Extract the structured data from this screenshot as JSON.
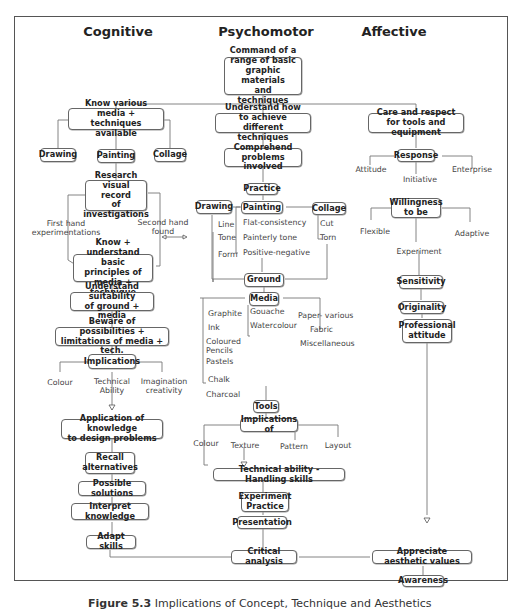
{
  "headers": {
    "cognitive": "Cognitive",
    "psychomotor": "Psychomotor",
    "affective": "Affective"
  },
  "root": "Command of a\nrange of basic\ngraphic materials\nand techniques",
  "cognitive": {
    "know_media": "Know various media +\ntechniques available",
    "drawing": "Drawing",
    "painting": "Painting",
    "collage": "Collage",
    "research": "Research visual\nrecord\nof investigations",
    "first_hand": "First hand\nexperimentations",
    "second_hand": "Second hand\nfound",
    "know_understand": "Know + understand\nbasic principles of\nmedia + technique",
    "suitability": "Understand suitability\nof ground + media",
    "beware": "Beware of possibilities +\nlimitations of media + tech.",
    "implications": "Implications",
    "impl_children": [
      "Colour",
      "Technical\nAbility",
      "Imagination\ncreativity"
    ],
    "application": "Application of knowledge\nto design problems",
    "recall": "Recall\nalternatives",
    "possible": "Possible solutions",
    "interpret": "Interpret knowledge",
    "adapt": "Adapt skills"
  },
  "psychomotor": {
    "understand": "Understand how to achieve\ndifferent techniques",
    "comprehend": "Comprehend problems\ninvolved",
    "practice": "Practice",
    "drawing": "Drawing",
    "drawing_items": [
      "Line",
      "Tone",
      "Form"
    ],
    "painting": "Painting",
    "painting_items": [
      "Flat-consistency",
      "Painterly tone",
      "Positive-negative"
    ],
    "collage": "Collage",
    "collage_items": [
      "Cut",
      "Torn"
    ],
    "ground": "Ground",
    "media": "Media",
    "media_left": [
      "Graphite",
      "Ink",
      "Coloured\nPencils",
      "Pastels",
      "Chalk",
      "Charcoal"
    ],
    "media_mid": [
      "Gouache",
      "Watercolour"
    ],
    "media_right": [
      "Paper- various",
      "Fabric",
      "Miscellaneous"
    ],
    "tools": "Tools",
    "implications_of": "Implications of",
    "impl_children": [
      "Colour",
      "Texture",
      "Pattern",
      "Layout"
    ],
    "technical": "Technical ability - Handling skills",
    "experiment": "Experiment\nPractice",
    "presentation": "Presentation",
    "critical": "Critical analysis"
  },
  "affective": {
    "care": "Care and respect\nfor tools and equipment",
    "response": "Response",
    "response_children": [
      "Attitude",
      "Initiative",
      "Enterprise"
    ],
    "willingness": "Willingness\nto be",
    "willingness_children": [
      "Flexible",
      "Adaptive"
    ],
    "experiment": "Experiment",
    "sensitivity": "Sensitivity",
    "originality": "Originality",
    "professional": "Professional\nattitude",
    "appreciate": "Appreciate aesthetic values",
    "awareness": "Awareness"
  },
  "caption": {
    "label": "Figure 5.3",
    "text": "Implications of Concept, Technique and Aesthetics"
  }
}
